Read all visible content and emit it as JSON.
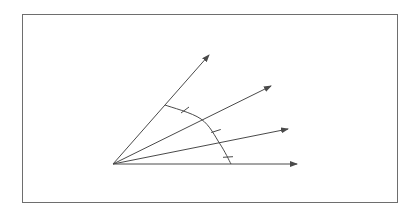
{
  "diagram": {
    "stroke_color": "#4a4a4a",
    "frame_color": "#6e6e6e",
    "vertex": {
      "x": 113,
      "y": 164
    },
    "rays": [
      {
        "id": "ray-1",
        "tip": {
          "x": 209,
          "y": 55
        }
      },
      {
        "id": "ray-2",
        "tip": {
          "x": 271,
          "y": 86
        }
      },
      {
        "id": "ray-3",
        "tip": {
          "x": 288,
          "y": 129
        }
      },
      {
        "id": "ray-4",
        "tip": {
          "x": 297,
          "y": 164
        }
      }
    ],
    "arc_points": [
      {
        "x": 165,
        "y": 105
      },
      {
        "x": 201,
        "y": 119
      },
      {
        "x": 220,
        "y": 144
      },
      {
        "x": 231,
        "y": 164
      }
    ],
    "tick_marks": [
      {
        "x": 185,
        "y": 110
      },
      {
        "x": 216,
        "y": 131
      },
      {
        "x": 228,
        "y": 157
      }
    ]
  }
}
